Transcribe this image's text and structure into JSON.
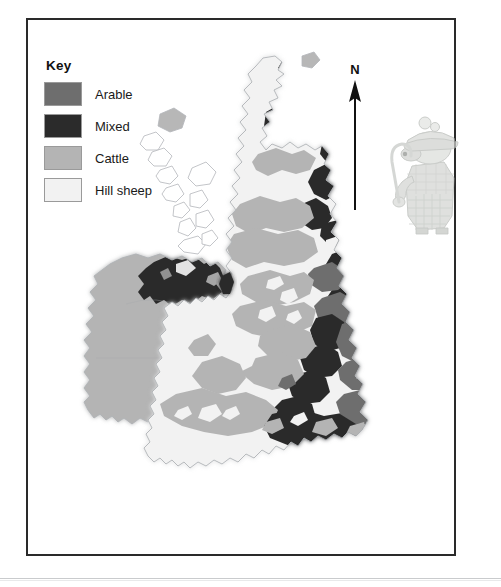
{
  "figure": {
    "type": "thematic-map",
    "region": "British Isles"
  },
  "legend": {
    "title": "Key",
    "items": [
      {
        "label": "Arable",
        "color": "#6e6e6e",
        "name": "arable"
      },
      {
        "label": "Mixed",
        "color": "#2b2b2b",
        "name": "mixed"
      },
      {
        "label": "Cattle",
        "color": "#b4b4b4",
        "name": "cattle"
      },
      {
        "label": "Hill sheep",
        "color": "#f2f2f2",
        "name": "hill-sheep"
      }
    ]
  },
  "compass": {
    "north_label": "N"
  },
  "illustration": {
    "name": "shepherd-character",
    "description": "Cartoon shepherd in deerstalker hat holding a crook"
  },
  "colors": {
    "frame": "#2a2a2a",
    "background": "#ffffff",
    "coastline": "#b9bcc0",
    "arable": "#6e6e6e",
    "mixed": "#2b2b2b",
    "cattle": "#b4b4b4",
    "hill_sheep": "#f2f2f2",
    "rule": "#c9cbcd"
  }
}
